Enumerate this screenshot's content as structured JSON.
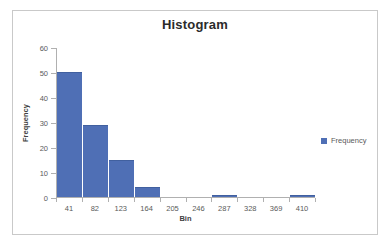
{
  "chart_data": {
    "type": "bar",
    "title": "Histogram",
    "xlabel": "Bin",
    "ylabel": "Frequency",
    "categories": [
      "41",
      "82",
      "123",
      "164",
      "205",
      "246",
      "287",
      "328",
      "369",
      "410"
    ],
    "values": [
      50,
      29,
      15,
      4,
      0,
      0,
      1,
      0,
      0,
      1
    ],
    "series": [
      {
        "name": "Frequency",
        "values": [
          50,
          29,
          15,
          4,
          0,
          0,
          1,
          0,
          0,
          1
        ]
      }
    ],
    "ylim": [
      0,
      60
    ],
    "yticks": [
      "0",
      "10",
      "20",
      "30",
      "40",
      "50",
      "60"
    ],
    "ytick_values": [
      0,
      10,
      20,
      30,
      40,
      50,
      60
    ],
    "grid": false,
    "legend": {
      "position": "right",
      "entries": [
        "Frequency"
      ]
    },
    "bar_color": "#4f6fb5",
    "axis_color": "#b0b0b0",
    "text_color": "#5a5a5a",
    "title_color": "#2b2b2b"
  },
  "legend": {
    "label": "Frequency"
  }
}
